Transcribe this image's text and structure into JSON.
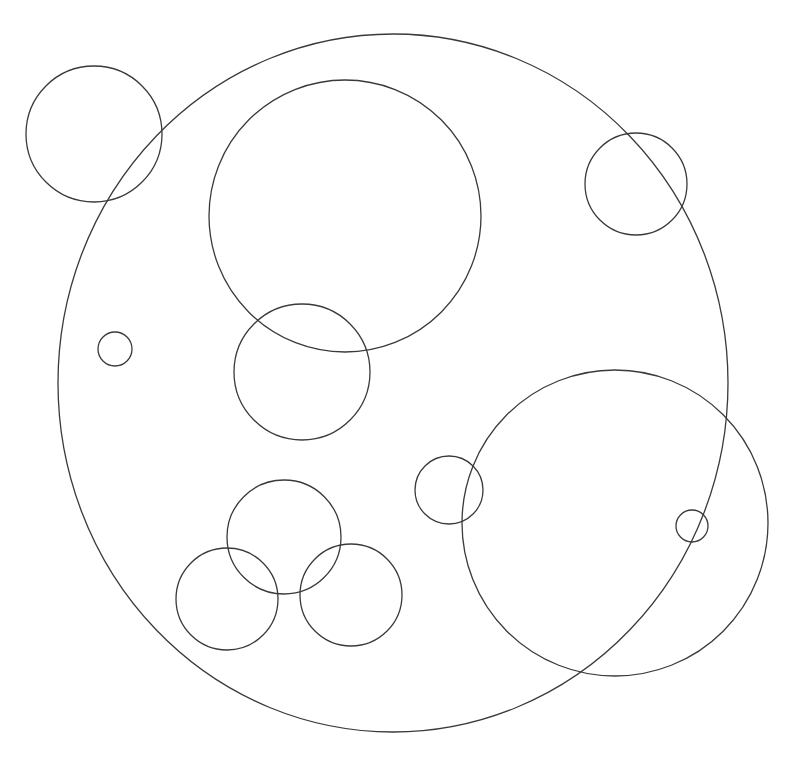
{
  "diagram": {
    "type": "circles",
    "background": "#ffffff",
    "stroke_color": "#3a3a3a",
    "stroke_width": 1.3,
    "outer_circle": {
      "cx": 393,
      "cy": 383,
      "rx": 335,
      "ry": 349
    },
    "circles": [
      {
        "id": "top-left",
        "cx": 94,
        "cy": 134,
        "r": 68
      },
      {
        "id": "upper-large",
        "cx": 345,
        "cy": 216,
        "r": 136
      },
      {
        "id": "upper-right-small",
        "cx": 636,
        "cy": 184,
        "r": 51
      },
      {
        "id": "left-tiny",
        "cx": 115,
        "cy": 349,
        "r": 17
      },
      {
        "id": "middle",
        "cx": 302,
        "cy": 372,
        "r": 68
      },
      {
        "id": "center-small",
        "cx": 449,
        "cy": 490,
        "r": 34
      },
      {
        "id": "lower-right-large",
        "cx": 615,
        "cy": 523,
        "r": 153
      },
      {
        "id": "right-tiny",
        "cx": 692,
        "cy": 526,
        "r": 16
      },
      {
        "id": "cluster-top",
        "cx": 284,
        "cy": 537,
        "r": 57
      },
      {
        "id": "cluster-left",
        "cx": 227,
        "cy": 599,
        "r": 51
      },
      {
        "id": "cluster-right",
        "cx": 351,
        "cy": 595,
        "r": 51
      }
    ]
  }
}
